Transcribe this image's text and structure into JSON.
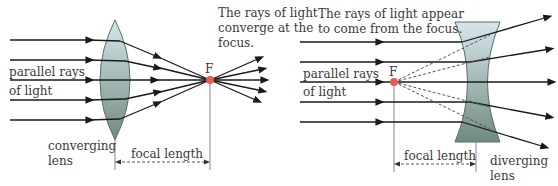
{
  "converging": {
    "caption": [
      "The rays of light",
      "converge at the",
      "focus."
    ],
    "input_label": [
      "parallel rays",
      "of light"
    ],
    "lens_label": [
      "converging",
      "lens"
    ],
    "focus_label": "F",
    "focal_length_label": "focal length"
  },
  "diverging": {
    "caption": [
      "The rays of light appear",
      "to come from the focus."
    ],
    "input_label": [
      "parallel rays",
      "of light"
    ],
    "lens_label": [
      "diverging",
      "lens"
    ],
    "focus_label": "F",
    "focal_length_label": "focal length"
  },
  "colors": {
    "ray": "#1a1a1a",
    "focus_dot": "#e0604a",
    "lens_top": "#d6e6ec",
    "lens_bottom": "#6f8a80",
    "guide": "#999999"
  }
}
